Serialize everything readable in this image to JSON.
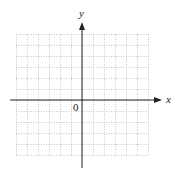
{
  "figure": {
    "type": "coordinate-plane",
    "x_axis_label": "x",
    "y_axis_label": "y",
    "origin_label": "0",
    "grid": {
      "columns": 12,
      "rows": 11,
      "columns_left_of_y_axis": 6,
      "columns_right_of_y_axis": 6,
      "rows_above_x_axis": 6,
      "rows_below_x_axis": 5,
      "line_style": "dotted",
      "line_color": "#b8b8b8"
    },
    "axis_color": "#222222",
    "x_range_units": [
      -6,
      6
    ],
    "y_range_units": [
      -5,
      6
    ]
  }
}
